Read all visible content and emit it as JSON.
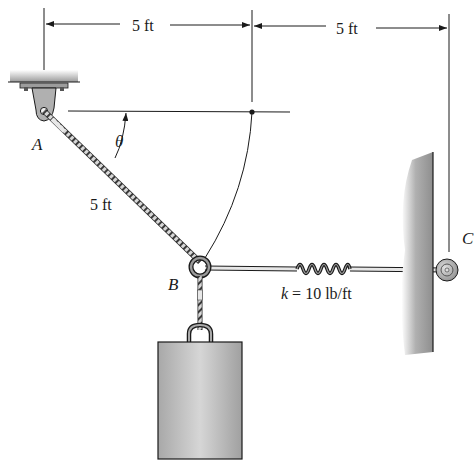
{
  "figure": {
    "type": "statics-mechanics-diagram",
    "dimensions": {
      "top_left": "5 ft",
      "top_right": "5 ft",
      "cable_length": "5 ft"
    },
    "points": {
      "A": "A",
      "B": "B",
      "C": "C"
    },
    "angle": "θ",
    "spring": {
      "label": "k = 10 lb/ft",
      "k_symbol": "k",
      "k_value": " = 10 lb/ft"
    },
    "colors": {
      "line": "#1a1a1a",
      "metal": "#b9b9b9",
      "wall_shade": "#9a9a9a",
      "block": "#bdbdbd"
    }
  }
}
